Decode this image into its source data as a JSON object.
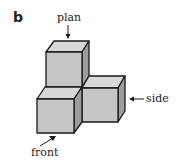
{
  "figure": {
    "panel_label": "b",
    "labels": {
      "plan": "plan",
      "side": "side",
      "front": "front"
    },
    "colors": {
      "top_face": "#d8d8d8",
      "front_face": "#c6c6c6",
      "side_face": "#9c9c9c",
      "edge": "#1a1a1a"
    }
  }
}
